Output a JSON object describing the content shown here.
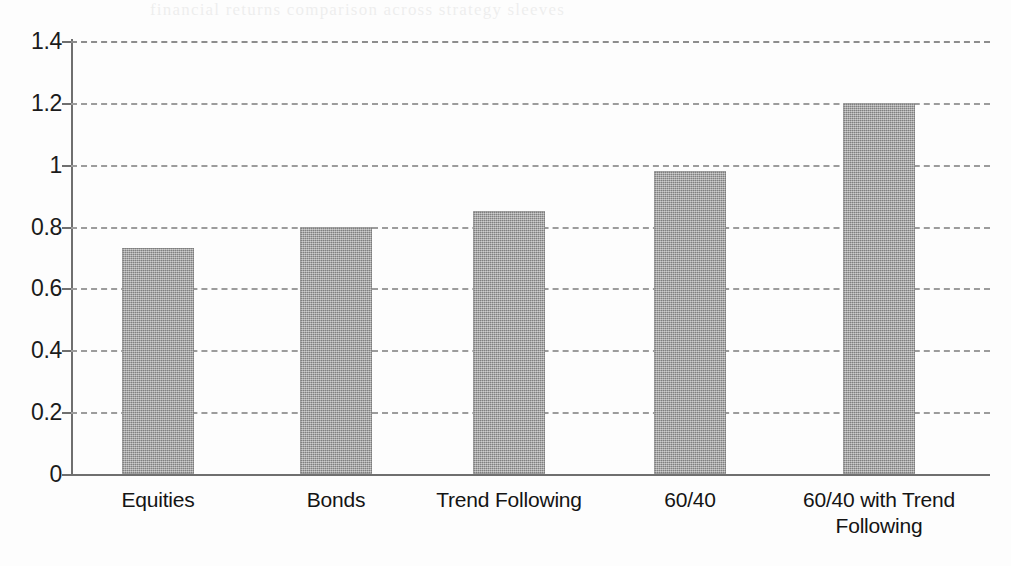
{
  "page": {
    "background_color": "#fdfdfd",
    "bleed_text": "financial returns comparison across strategy sleeves"
  },
  "chart_data": {
    "type": "bar",
    "title": "",
    "subtitle": "",
    "xlabel": "",
    "ylabel": "",
    "categories": [
      "Equities",
      "Bonds",
      "Trend Following",
      "60/40",
      "60/40 with Trend Following"
    ],
    "category_lines": [
      [
        "Equities"
      ],
      [
        "Bonds"
      ],
      [
        "Trend Following"
      ],
      [
        "60/40"
      ],
      [
        "60/40 with Trend",
        "Following"
      ]
    ],
    "values": [
      0.73,
      0.8,
      0.85,
      0.98,
      1.2
    ],
    "ylim": [
      0,
      1.4
    ],
    "ytick_labels": [
      "0",
      "0.2",
      "0.4",
      "0.6",
      "0.8",
      "1",
      "1.2",
      "1.4"
    ],
    "ytick_values": [
      0,
      0.2,
      0.4,
      0.6,
      0.8,
      1.0,
      1.2,
      1.4
    ],
    "grid": true,
    "grid_style": "dashed",
    "grid_color": "#9c9c9c",
    "legend": false,
    "legend_position": "none",
    "bar_color": "#9d9d9d",
    "axis_color": "#6f6f6f",
    "text_color": "#141414"
  }
}
